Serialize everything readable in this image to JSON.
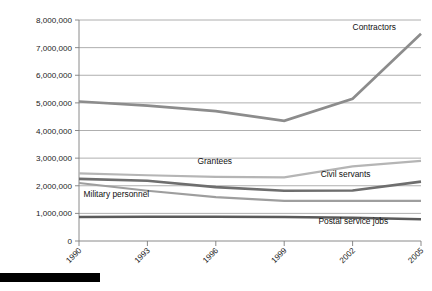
{
  "chart_data": {
    "type": "line",
    "title": "",
    "subtitle": "",
    "xlabel": "",
    "ylabel": "",
    "x": [
      1990,
      1993,
      1996,
      1999,
      2002,
      2005
    ],
    "x_tick_labels": [
      "1990",
      "1993",
      "1996",
      "1999",
      "2002",
      "2005"
    ],
    "y_tick_labels": [
      "0",
      "1,000,000",
      "2,000,000",
      "3,000,000",
      "4,000,000",
      "5,000,000",
      "6,000,000",
      "7,000,000",
      "8,000,000"
    ],
    "y_ticks": [
      0,
      1000000,
      2000000,
      3000000,
      4000000,
      5000000,
      6000000,
      7000000,
      8000000
    ],
    "ylim": [
      0,
      8000000
    ],
    "xlim": [
      1990,
      2005
    ],
    "grid": true,
    "legend_position": "inline-labels",
    "series": [
      {
        "name": "Contractors",
        "color": "#8c8c8c",
        "width": 2.6,
        "label_x": 2002.0,
        "label_y": 7650000,
        "values": [
          5050000,
          4900000,
          4700000,
          4350000,
          5150000,
          7500000
        ]
      },
      {
        "name": "Grantees",
        "color": "#b5b5b5",
        "width": 2.2,
        "label_x": 1995.2,
        "label_y": 2780000,
        "values": [
          2450000,
          2380000,
          2320000,
          2300000,
          2700000,
          2900000
        ]
      },
      {
        "name": "Civil servants",
        "color": "#6e6e6e",
        "width": 2.6,
        "label_x": 2000.6,
        "label_y": 2330000,
        "values": [
          2250000,
          2180000,
          1950000,
          1820000,
          1830000,
          2150000
        ]
      },
      {
        "name": "Military personnel",
        "color": "#9e9e9e",
        "width": 2.2,
        "label_x": 1990.2,
        "label_y": 1580000,
        "values": [
          2100000,
          1820000,
          1590000,
          1450000,
          1450000,
          1450000
        ]
      },
      {
        "name": "Postal service jobs",
        "color": "#5a5a5a",
        "width": 2.6,
        "label_x": 2000.5,
        "label_y": 620000,
        "values": [
          870000,
          880000,
          880000,
          870000,
          840000,
          790000
        ]
      }
    ]
  },
  "footer": {
    "bar_color": "#000000"
  }
}
